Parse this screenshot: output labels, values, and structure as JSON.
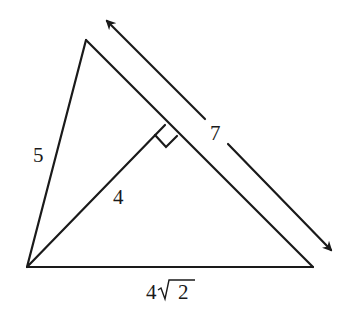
{
  "diagram": {
    "type": "triangle-with-altitude",
    "vertices": {
      "top": [
        86,
        40
      ],
      "bottom_left": [
        27,
        267
      ],
      "bottom_right": [
        313,
        267
      ],
      "altitude_foot": [
        165,
        125
      ]
    },
    "labels": {
      "left_side": "5",
      "altitude": "4",
      "right_side_length": "7",
      "base_coef": "4",
      "base_radicand": "2"
    },
    "right_angle_marker": true,
    "dimension_arrow": {
      "from": [
        105,
        19
      ],
      "to": [
        333,
        252
      ],
      "label": "7"
    },
    "colors": {
      "stroke": "#1a1a1a",
      "background": "#ffffff"
    }
  }
}
